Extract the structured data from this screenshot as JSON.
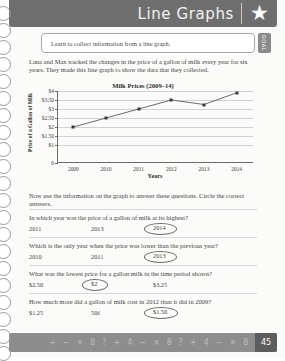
{
  "header": {
    "title": "Line Graphs",
    "star_icon": "star-icon"
  },
  "goal": {
    "text": "Learn to collect information from a line graph.",
    "tab_label": "GOAL"
  },
  "intro": {
    "paragraph": "Lana and Max tracked the changes in the price of a gallon of milk every year for six years. They made this line graph to show the data that they collected."
  },
  "instructions": {
    "text": "Now use the information on the graph to answer these questions. Circle the correct answers."
  },
  "chart_data": {
    "type": "line",
    "title": "Milk Prices (2009–14)",
    "xlabel": "Years",
    "ylabel": "Price of a Gallon of Milk",
    "categories": [
      "2009",
      "2010",
      "2011",
      "2012",
      "2013",
      "2014"
    ],
    "values": [
      2.0,
      2.5,
      3.0,
      3.5,
      3.25,
      3.9
    ],
    "ylim": [
      0,
      4
    ],
    "ytick_labels": [
      "$4",
      "$3.50",
      "$3",
      "$2.50",
      "$2",
      "$1.50",
      "$1",
      "0"
    ],
    "ytick_values": [
      4,
      3.5,
      3,
      2.5,
      2,
      1.5,
      1,
      0
    ],
    "grid": true,
    "legend": "none",
    "line_color": "#5a5a5a",
    "marker_color": "#3a3a3a"
  },
  "questions": [
    {
      "number": "1",
      "text": "In which year was the price of a gallon of milk at its highest?",
      "options": [
        "2011",
        "2013",
        "2014"
      ],
      "circled_index": 2
    },
    {
      "number": "2",
      "text": "Which is the only year when the price was lower than the previous year?",
      "options": [
        "2010",
        "2011",
        "2013"
      ],
      "circled_index": 2
    },
    {
      "number": "3",
      "text": "What was the lowest price for a gallon milk in the time period shown?",
      "options": [
        "$2.50",
        "$2",
        "$3.25"
      ],
      "circled_index": 1
    },
    {
      "number": "4",
      "text": "How much more did a gallon of milk cost in 2012 than it did in 2009?",
      "options": [
        "$1.25",
        "50¢",
        "$1.50"
      ],
      "circled_index": 2
    }
  ],
  "footer": {
    "page_number": "45",
    "symbols": [
      "÷",
      "−",
      "×",
      "8",
      "?",
      "+",
      "4",
      "−",
      "×",
      "8",
      "?",
      "+",
      "4",
      "−",
      "×",
      "8",
      "?",
      "÷",
      "×"
    ]
  }
}
